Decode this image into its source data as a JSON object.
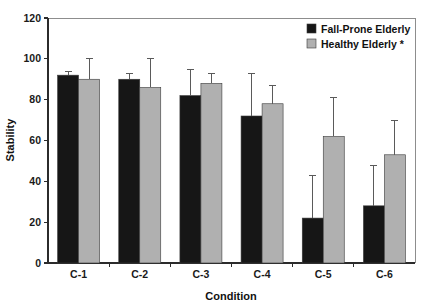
{
  "chart_data": {
    "type": "bar",
    "title": "",
    "xlabel": "Condition",
    "ylabel": "Stability",
    "categories": [
      "C-1",
      "C-2",
      "C-3",
      "C-4",
      "C-5",
      "C-6"
    ],
    "ylim": [
      0,
      120
    ],
    "yticks": [
      0,
      20,
      40,
      60,
      80,
      100,
      120
    ],
    "ytick_labels": [
      "0",
      "20",
      "40",
      "60",
      "80",
      "100",
      "120"
    ],
    "grid": false,
    "legend_position": "top-right",
    "series": [
      {
        "name": "Fall-Prone Elderly",
        "color": "#161616",
        "values": [
          92,
          90,
          82,
          72,
          22,
          28
        ],
        "errors": [
          2,
          3,
          13,
          21,
          21,
          20
        ]
      },
      {
        "name": "Healthy Elderly *",
        "color": "#b0b0b0",
        "values": [
          90,
          86,
          88,
          78,
          62,
          53
        ],
        "errors": [
          10,
          14,
          5,
          9,
          19,
          17
        ]
      }
    ]
  },
  "legend": {
    "items": [
      {
        "label": "Fall-Prone Elderly",
        "swatch": "#161616"
      },
      {
        "label": "Healthy Elderly *",
        "swatch": "#b0b0b0"
      }
    ]
  },
  "axes": {
    "y_title": "Stability",
    "x_title": "Condition"
  }
}
